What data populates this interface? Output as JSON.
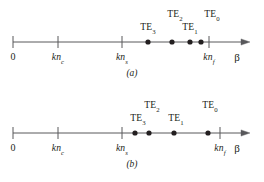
{
  "figure": {
    "axis_variable": "β",
    "panels": [
      {
        "id": "a",
        "caption": "(a)",
        "axis": {
          "variable_label": "β",
          "x_start": 13,
          "x_end": 250,
          "y": 42,
          "arrow": true
        },
        "ticks": [
          {
            "name": "origin",
            "label_main": "0",
            "label_sub": "",
            "x": 13,
            "italic": false
          },
          {
            "name": "k-n-cladding",
            "label_main": "kn",
            "label_sub": "c",
            "x": 58,
            "italic": true
          },
          {
            "name": "k-n-substrate",
            "label_main": "kn",
            "label_sub": "s",
            "x": 122,
            "italic": true
          },
          {
            "name": "k-n-film",
            "label_main": "kn",
            "label_sub": "f",
            "x": 209,
            "italic": true
          }
        ],
        "modes": [
          {
            "name": "TE3",
            "label_main": "TE",
            "label_sub": "3",
            "dot_x": 148,
            "label_x": 148,
            "label_y": 22
          },
          {
            "name": "TE2",
            "label_main": "TE",
            "label_sub": "2",
            "dot_x": 172,
            "label_x": 175,
            "label_y": 9
          },
          {
            "name": "TE1",
            "label_main": "TE",
            "label_sub": "1",
            "dot_x": 190,
            "label_x": 190,
            "label_y": 22
          },
          {
            "name": "TE0",
            "label_main": "TE",
            "label_sub": "0",
            "dot_x": 201,
            "label_x": 212,
            "label_y": 9
          }
        ]
      },
      {
        "id": "b",
        "caption": "(b)",
        "axis": {
          "variable_label": "β",
          "x_start": 13,
          "x_end": 250,
          "y": 42,
          "arrow": true
        },
        "ticks": [
          {
            "name": "origin",
            "label_main": "0",
            "label_sub": "",
            "x": 13,
            "italic": false
          },
          {
            "name": "k-n-cladding",
            "label_main": "kn",
            "label_sub": "c",
            "x": 58,
            "italic": true
          },
          {
            "name": "k-n-substrate",
            "label_main": "kn",
            "label_sub": "s",
            "x": 122,
            "italic": true
          },
          {
            "name": "k-n-film",
            "label_main": "kn",
            "label_sub": "f",
            "x": 220,
            "italic": true
          }
        ],
        "modes": [
          {
            "name": "TE3",
            "label_main": "TE",
            "label_sub": "3",
            "dot_x": 135,
            "label_x": 138,
            "label_y": 22
          },
          {
            "name": "TE2",
            "label_main": "TE",
            "label_sub": "2",
            "dot_x": 149,
            "label_x": 152,
            "label_y": 9
          },
          {
            "name": "TE1",
            "label_main": "TE",
            "label_sub": "1",
            "dot_x": 174,
            "label_x": 176,
            "label_y": 22
          },
          {
            "name": "TE0",
            "label_main": "TE",
            "label_sub": "0",
            "dot_x": 208,
            "label_x": 210,
            "label_y": 9
          }
        ]
      }
    ],
    "style": {
      "line_color": "#58585b",
      "dot_color": "#231f20",
      "text_color": "#231f20",
      "background": "#ffffff",
      "dot_radius": 2.6,
      "tick_half_height": 6
    }
  }
}
